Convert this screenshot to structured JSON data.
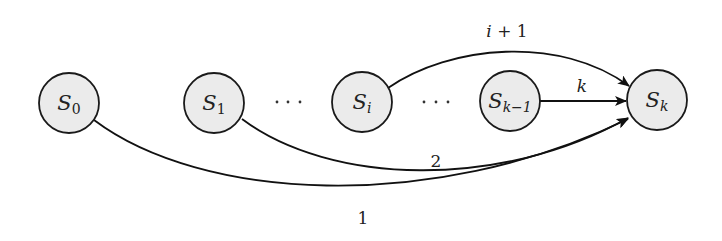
{
  "diagram": {
    "type": "state-transition-graph",
    "colors": {
      "node_fill": "#ebebeb",
      "node_stroke": "#1a1a1a",
      "edge": "#111111",
      "background": "#ffffff"
    },
    "nodes": [
      {
        "id": "S0",
        "label": "S",
        "subscript": "0",
        "cx": 69,
        "cy": 103,
        "r": 30
      },
      {
        "id": "S1",
        "label": "S",
        "subscript": "1",
        "cx": 214,
        "cy": 103,
        "r": 30
      },
      {
        "id": "Si",
        "label": "S",
        "subscript": "i",
        "cx": 362,
        "cy": 102,
        "r": 30
      },
      {
        "id": "Sk-1",
        "label": "S",
        "subscript": "k−1",
        "cx": 510,
        "cy": 101,
        "r": 30
      },
      {
        "id": "Sk",
        "label": "S",
        "subscript": "k",
        "cx": 657,
        "cy": 100,
        "r": 30
      }
    ],
    "ellipses": [
      {
        "text": "· · ·",
        "x": 288,
        "y": 102
      },
      {
        "text": "· · ·",
        "x": 436,
        "y": 102
      }
    ],
    "edges": [
      {
        "from": "S0",
        "to": "Sk",
        "label": "1"
      },
      {
        "from": "S1",
        "to": "Sk",
        "label": "2"
      },
      {
        "from": "Si",
        "to": "Sk",
        "label": "i + 1"
      },
      {
        "from": "Sk-1",
        "to": "Sk",
        "label": "k"
      }
    ],
    "labels": {
      "edge_1": "1",
      "edge_2": "2",
      "edge_i_plus_1_var": "i",
      "edge_i_plus_1_rest": " + 1",
      "edge_k": "k",
      "node_S0_main": "S",
      "node_S0_sub": "0",
      "node_S1_main": "S",
      "node_S1_sub": "1",
      "node_Si_main": "S",
      "node_Si_sub": "i",
      "node_Sk1_main": "S",
      "node_Sk1_sub": "k−1",
      "node_Sk_main": "S",
      "node_Sk_sub": "k"
    }
  }
}
